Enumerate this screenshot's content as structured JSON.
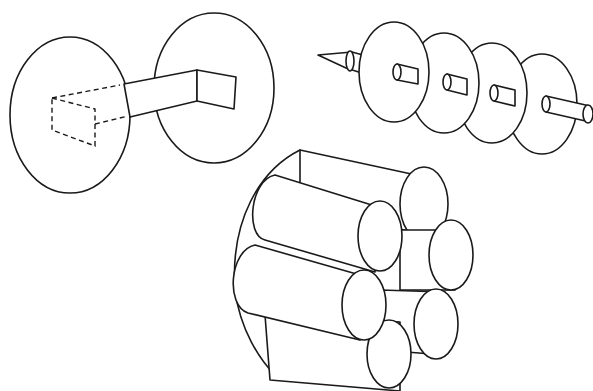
{
  "figure": {
    "panels": [
      {
        "id": "two-disks-with-bar",
        "description": "Two elliptical disks connected by a rectangular bar; hidden portion shown dashed"
      },
      {
        "id": "skewer-with-disks",
        "description": "Pointed rod threaded through four disks"
      },
      {
        "id": "cylinder-bundle",
        "description": "Bundle of seven cylinders packed inside a rounded casing"
      }
    ],
    "colors": {
      "stroke": "#1a1a1a",
      "background": "#ffffff"
    }
  }
}
